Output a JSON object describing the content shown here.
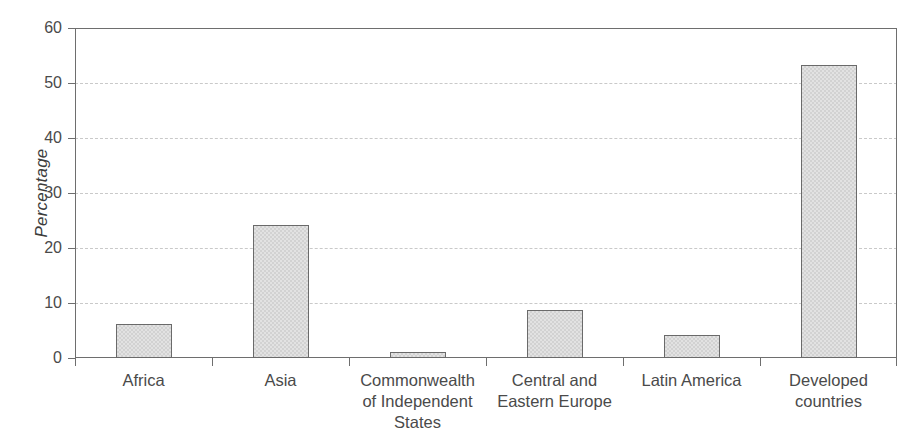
{
  "chart_data": {
    "type": "bar",
    "title": "",
    "subtitle": "",
    "xlabel": "",
    "ylabel": "Percentage",
    "categories": [
      "Africa",
      "Asia",
      "Commonwealth\nof Independent\nStates",
      "Central and\nEastern Europe",
      "Latin America",
      "Developed\ncountries"
    ],
    "values": [
      6.1,
      24.2,
      1.1,
      8.8,
      4.1,
      53.3
    ],
    "ylim": [
      0,
      60
    ],
    "ytick_labels": [
      "0",
      "10",
      "20",
      "30",
      "40",
      "50",
      "60"
    ],
    "ytick_values": [
      0,
      10,
      20,
      30,
      40,
      50,
      60
    ],
    "grid": true,
    "grid_axis": "y",
    "grid_style": "dashed",
    "legend": null,
    "legend_position": "none",
    "bar_fill_color": "#e2e2e2",
    "bar_edge_color": "#6a6a6a",
    "axis_color": "#6e6e6e",
    "grid_color": "#c9c9c9",
    "text_color": "#4a4a4a",
    "background_color": "#ffffff"
  }
}
